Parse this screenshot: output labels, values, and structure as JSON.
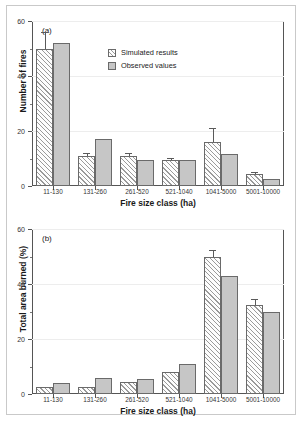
{
  "figure": {
    "background": "#ffffff",
    "border_color": "#c9c9c9"
  },
  "legend": {
    "simulated_label": "Simulated results",
    "observed_label": "Observed values"
  },
  "panels": [
    {
      "id": "a",
      "panel_label": "(a)",
      "ylabel": "Number of fires",
      "xlabel": "Fire size class (ha)"
    },
    {
      "id": "b",
      "panel_label": "(b)",
      "ylabel": "Total area burned (%)",
      "xlabel": "Fire size class (ha)"
    }
  ],
  "chart_data": [
    {
      "type": "bar",
      "title": "(a)",
      "xlabel": "Fire size class (ha)",
      "ylabel": "Number of fires",
      "ylim": [
        0,
        60
      ],
      "yticks": [
        0,
        20,
        40,
        60
      ],
      "yminor_ticks": [
        10,
        30,
        50
      ],
      "grid": true,
      "legend_position": "upper center",
      "categories": [
        "11-130",
        "131-260",
        "261-520",
        "521-1040",
        "1041-5000",
        "5001-10000"
      ],
      "series": [
        {
          "name": "Simulated results",
          "fill": "hatched",
          "color": "#ffffff",
          "values": [
            50,
            11,
            11,
            9.5,
            16,
            4.5
          ],
          "errors": [
            6,
            1,
            1,
            0.7,
            5,
            0.7
          ]
        },
        {
          "name": "Observed values",
          "fill": "solid",
          "color": "#c6c6c6",
          "values": [
            52,
            17,
            9.5,
            9.5,
            11.5,
            2.5
          ],
          "errors": [
            0,
            0,
            0,
            0,
            0,
            0
          ]
        }
      ]
    },
    {
      "type": "bar",
      "title": "(b)",
      "xlabel": "Fire size class (ha)",
      "ylabel": "Total area burned (%)",
      "ylim": [
        0,
        60
      ],
      "yticks": [
        0,
        20,
        40,
        60
      ],
      "yminor_ticks": [
        10,
        30,
        50
      ],
      "grid": true,
      "legend_position": "upper center",
      "categories": [
        "11-130",
        "131-260",
        "261-520",
        "521-1040",
        "1041-5000",
        "5001-10000"
      ],
      "series": [
        {
          "name": "Simulated results",
          "fill": "hatched",
          "color": "#ffffff",
          "values": [
            2.5,
            2.5,
            4.5,
            8,
            50,
            32.5
          ],
          "errors": [
            0,
            0,
            0,
            0,
            2.5,
            2
          ]
        },
        {
          "name": "Observed values",
          "fill": "solid",
          "color": "#c6c6c6",
          "values": [
            4,
            6,
            5.5,
            11,
            43,
            30
          ],
          "errors": [
            0,
            0,
            0,
            0,
            0,
            0
          ]
        }
      ]
    }
  ]
}
